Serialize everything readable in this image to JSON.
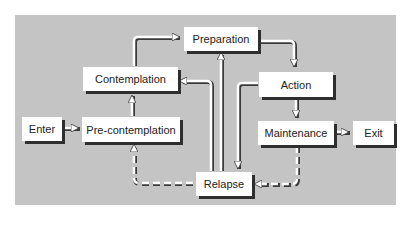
{
  "diagram": {
    "colors": {
      "background": "#c4c4c4",
      "box_fill": "#ffffff",
      "box_shadow": "#2e2e2e",
      "arrow": "#ffffff",
      "arrow_shadow": "#3a3a3a"
    },
    "nodes": {
      "enter": "Enter",
      "precontemplation": "Pre-contemplation",
      "contemplation": "Contemplation",
      "preparation": "Preparation",
      "action": "Action",
      "maintenance": "Maintenance",
      "exit": "Exit",
      "relapse": "Relapse"
    },
    "edges": [
      {
        "from": "Enter",
        "to": "Pre-contemplation",
        "style": "solid"
      },
      {
        "from": "Pre-contemplation",
        "to": "Contemplation",
        "style": "solid"
      },
      {
        "from": "Contemplation",
        "to": "Preparation",
        "style": "solid"
      },
      {
        "from": "Preparation",
        "to": "Action",
        "style": "solid"
      },
      {
        "from": "Action",
        "to": "Maintenance",
        "style": "solid"
      },
      {
        "from": "Maintenance",
        "to": "Exit",
        "style": "solid"
      },
      {
        "from": "Action",
        "to": "Relapse",
        "style": "solid"
      },
      {
        "from": "Relapse",
        "to": "Contemplation",
        "style": "solid"
      },
      {
        "from": "Relapse",
        "to": "Preparation",
        "style": "solid"
      },
      {
        "from": "Relapse",
        "to": "Pre-contemplation",
        "style": "dashed"
      },
      {
        "from": "Maintenance",
        "to": "Relapse",
        "style": "dashed"
      }
    ]
  }
}
